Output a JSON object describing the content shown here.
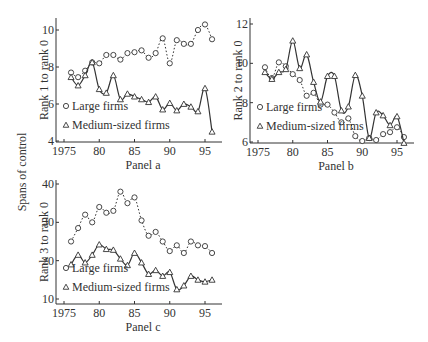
{
  "figure": {
    "shared_ylabel": "Spans of control",
    "legend": {
      "large": "Large firms",
      "medium": "Medium-sized firms"
    }
  },
  "chart_data": [
    {
      "type": "line",
      "title": "Panel a",
      "xlabel": "Panel a",
      "ylabel": "Rank 1 to rank 0",
      "x": [
        1976,
        1977,
        1978,
        1979,
        1980,
        1981,
        1982,
        1983,
        1984,
        1985,
        1986,
        1987,
        1988,
        1989,
        1990,
        1991,
        1992,
        1993,
        1994,
        1995,
        1996
      ],
      "xticks": [
        1975,
        1980,
        1985,
        1990,
        1995
      ],
      "xtick_labels": [
        "1975",
        "80",
        "85",
        "90",
        "95"
      ],
      "yticks": [
        4,
        6,
        8,
        10
      ],
      "ylim": [
        3.95,
        10.6
      ],
      "xlim": [
        1974.5,
        1996.7
      ],
      "grid": false,
      "legend_position": "lower left",
      "series": [
        {
          "name": "Large firms",
          "marker": "circle",
          "line": "dotted",
          "values": [
            7.7,
            7.45,
            7.8,
            8.25,
            8.2,
            8.65,
            8.65,
            8.4,
            8.75,
            8.8,
            8.9,
            8.5,
            8.75,
            9.55,
            8.2,
            9.45,
            9.25,
            9.25,
            10.0,
            10.3,
            9.5
          ]
        },
        {
          "name": "Medium-sized firms",
          "marker": "triangle",
          "line": "solid",
          "values": [
            7.45,
            7.0,
            7.55,
            8.25,
            6.8,
            6.6,
            7.55,
            6.25,
            6.55,
            6.4,
            6.25,
            6.1,
            6.4,
            5.7,
            6.05,
            5.65,
            6.0,
            5.85,
            5.6,
            6.85,
            4.5
          ]
        }
      ]
    },
    {
      "type": "line",
      "title": "Panel b",
      "xlabel": "Panel b",
      "ylabel": "Rank 2 to rank 0",
      "x": [
        1976,
        1977,
        1978,
        1979,
        1980,
        1981,
        1982,
        1983,
        1984,
        1985,
        1986,
        1987,
        1988,
        1989,
        1990,
        1991,
        1992,
        1993,
        1994,
        1995,
        1996
      ],
      "xticks": [
        1975,
        1980,
        1985,
        1990,
        1995
      ],
      "xtick_labels": [
        "1975",
        "80",
        "85",
        "90",
        "95"
      ],
      "yticks": [
        6,
        8,
        10,
        12
      ],
      "ylim": [
        5.95,
        12.1
      ],
      "xlim": [
        1974.5,
        1996.7
      ],
      "grid": false,
      "legend_position": "lower left",
      "series": [
        {
          "name": "Large firms",
          "marker": "circle",
          "line": "dotted",
          "values": [
            9.8,
            9.25,
            10.05,
            9.85,
            9.45,
            9.15,
            8.35,
            8.5,
            7.9,
            7.9,
            7.5,
            7.0,
            7.2,
            6.3,
            6.05,
            6.2,
            6.1,
            6.4,
            6.5,
            6.75,
            6.25
          ]
        },
        {
          "name": "Medium-sized firms",
          "marker": "triangle",
          "line": "solid",
          "values": [
            9.55,
            9.2,
            9.55,
            9.7,
            11.15,
            9.75,
            10.45,
            9.05,
            8.05,
            9.35,
            9.35,
            7.6,
            7.8,
            9.4,
            8.35,
            6.2,
            7.5,
            7.35,
            6.85,
            7.3,
            5.95
          ]
        }
      ]
    },
    {
      "type": "line",
      "title": "Panel c",
      "xlabel": "Panel c",
      "ylabel": "Rank 3 to rank 0",
      "x": [
        1976,
        1977,
        1978,
        1979,
        1980,
        1981,
        1982,
        1983,
        1984,
        1985,
        1986,
        1987,
        1988,
        1989,
        1990,
        1991,
        1992,
        1993,
        1994,
        1995,
        1996
      ],
      "xticks": [
        1975,
        1980,
        1985,
        1990,
        1995
      ],
      "xtick_labels": [
        "1975",
        "80",
        "85",
        "90",
        "95"
      ],
      "yticks": [
        10,
        20,
        30,
        40
      ],
      "ylim": [
        9.5,
        40.5
      ],
      "xlim": [
        1974.5,
        1996.7
      ],
      "grid": false,
      "legend_position": "lower left",
      "series": [
        {
          "name": "Large firms",
          "marker": "circle",
          "line": "dotted",
          "values": [
            25,
            28.5,
            32,
            30,
            34,
            32.5,
            33,
            38,
            35,
            36.5,
            30.5,
            26.5,
            27.5,
            25,
            22.5,
            24,
            22,
            25,
            24,
            23.8,
            22
          ]
        },
        {
          "name": "Medium-sized firms",
          "marker": "triangle",
          "line": "solid",
          "values": [
            19,
            21.5,
            19.5,
            21.5,
            24.2,
            23,
            22.8,
            20.5,
            18.8,
            22,
            19.5,
            16.5,
            17.5,
            16,
            17,
            12.5,
            13.5,
            16,
            15,
            14.5,
            15
          ]
        }
      ]
    }
  ]
}
